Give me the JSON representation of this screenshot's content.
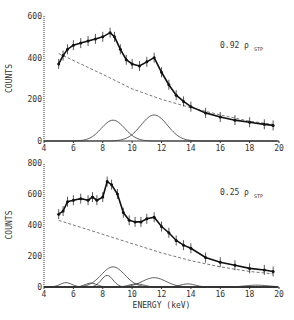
{
  "chart_data": [
    {
      "type": "scatter",
      "title": "",
      "annotation": {
        "main": "0.92 ρ",
        "sub": "STP"
      },
      "xlabel": "",
      "ylabel": "COUNTS",
      "xlim": [
        4,
        20
      ],
      "ylim": [
        0,
        600
      ],
      "xticks": [
        "4",
        "6",
        "8",
        "10",
        "12",
        "14",
        "16",
        "18",
        "20"
      ],
      "yticks": [
        "0",
        "200",
        "400",
        "600"
      ],
      "data_points": {
        "x": [
          5,
          5.3,
          5.6,
          6,
          6.5,
          7,
          7.5,
          8,
          8.5,
          8.8,
          9.2,
          9.6,
          10,
          10.5,
          11,
          11.5,
          12,
          12.5,
          13,
          13.5,
          14,
          15,
          16,
          17,
          18,
          19,
          19.6
        ],
        "y": [
          370,
          410,
          440,
          460,
          470,
          480,
          490,
          500,
          520,
          500,
          440,
          390,
          370,
          360,
          380,
          400,
          330,
          270,
          220,
          190,
          165,
          135,
          115,
          100,
          90,
          80,
          75
        ]
      },
      "background_dashed": {
        "x": [
          5,
          8,
          10,
          12,
          14,
          16,
          18,
          19.6
        ],
        "y": [
          420,
          320,
          250,
          200,
          160,
          125,
          95,
          80
        ]
      },
      "peaks": [
        {
          "center": 8.7,
          "height": 100,
          "width": 0.8
        },
        {
          "center": 11.5,
          "height": 125,
          "width": 0.9
        }
      ]
    },
    {
      "type": "scatter",
      "title": "",
      "annotation": {
        "main": "0.25 ρ",
        "sub": "STP"
      },
      "xlabel": "ENERGY (keV)",
      "ylabel": "COUNTS",
      "xlim": [
        4,
        20
      ],
      "ylim": [
        0,
        800
      ],
      "xticks": [
        "4",
        "6",
        "8",
        "10",
        "12",
        "14",
        "16",
        "18",
        "20"
      ],
      "yticks": [
        "0",
        "200",
        "400",
        "600",
        "800"
      ],
      "data_points": {
        "x": [
          5,
          5.3,
          5.6,
          6,
          6.5,
          7,
          7.3,
          7.6,
          8,
          8.3,
          8.6,
          9,
          9.4,
          9.8,
          10.2,
          10.6,
          11,
          11.5,
          12,
          12.5,
          13,
          13.5,
          14,
          15,
          16,
          17,
          18,
          19,
          19.6
        ],
        "y": [
          470,
          490,
          550,
          560,
          570,
          560,
          580,
          560,
          580,
          680,
          660,
          600,
          480,
          430,
          420,
          420,
          440,
          450,
          390,
          350,
          300,
          270,
          250,
          190,
          160,
          140,
          120,
          110,
          100
        ]
      },
      "background_dashed": {
        "x": [
          5,
          8,
          10,
          12,
          14,
          16,
          18,
          19.6
        ],
        "y": [
          430,
          340,
          280,
          220,
          170,
          130,
          100,
          85
        ]
      },
      "peaks": [
        {
          "center": 5.5,
          "height": 28,
          "width": 0.4
        },
        {
          "center": 7.2,
          "height": 25,
          "width": 0.4
        },
        {
          "center": 8.3,
          "height": 75,
          "width": 0.4
        },
        {
          "center": 8.7,
          "height": 130,
          "width": 0.8
        },
        {
          "center": 11.5,
          "height": 60,
          "width": 0.8
        },
        {
          "center": 10.3,
          "height": 20,
          "width": 0.5
        },
        {
          "center": 13.8,
          "height": 20,
          "width": 0.5
        },
        {
          "center": 18.5,
          "height": 12,
          "width": 0.8
        }
      ]
    }
  ]
}
